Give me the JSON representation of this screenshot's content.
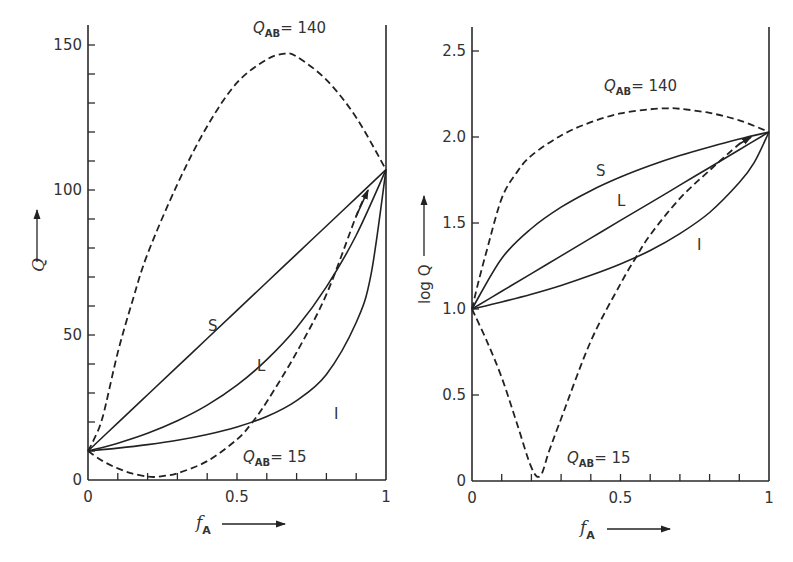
{
  "chart_data": [
    {
      "type": "line",
      "panel": "left",
      "title": "",
      "xlabel": "f_A",
      "ylabel": "Q",
      "xlim": [
        0,
        1
      ],
      "ylim": [
        0,
        158
      ],
      "x_ticks": [
        0,
        0.5,
        1
      ],
      "x_tick_labels": [
        "0",
        "0.5",
        "1"
      ],
      "x_minor_step": 0.1,
      "y_ticks": [
        0,
        50,
        100,
        150
      ],
      "y_tick_labels": [
        "0",
        "50",
        "100",
        "150"
      ],
      "y_minor_step": 10,
      "grid": false,
      "legend": "none (curves labeled inline)",
      "series": [
        {
          "name": "S",
          "style": "solid",
          "x": [
            0,
            0.1,
            0.2,
            0.3,
            0.4,
            0.5,
            0.6,
            0.7,
            0.8,
            0.9,
            1
          ],
          "values": [
            10,
            19.7,
            29.4,
            39.1,
            48.8,
            58.5,
            68.2,
            77.9,
            87.6,
            97.3,
            107
          ]
        },
        {
          "name": "L",
          "style": "solid",
          "x": [
            0,
            0.1,
            0.2,
            0.3,
            0.4,
            0.5,
            0.6,
            0.7,
            0.8,
            0.9,
            1
          ],
          "values": [
            10,
            12.7,
            16.1,
            20.4,
            25.8,
            32.7,
            41.5,
            52.5,
            66.6,
            84.4,
            107
          ]
        },
        {
          "name": "I",
          "style": "solid",
          "x": [
            0,
            0.1,
            0.2,
            0.3,
            0.4,
            0.5,
            0.6,
            0.7,
            0.8,
            0.9,
            0.95,
            1
          ],
          "values": [
            10,
            11.0,
            12.2,
            13.7,
            15.7,
            18.3,
            21.9,
            27.4,
            36.4,
            54.3,
            71,
            107
          ]
        },
        {
          "name": "Q_AB=140",
          "style": "dashed",
          "x": [
            0,
            0.02,
            0.05,
            0.1,
            0.15,
            0.2,
            0.3,
            0.4,
            0.5,
            0.6,
            0.66,
            0.7,
            0.8,
            0.9,
            1
          ],
          "values": [
            10,
            14,
            22,
            44,
            62,
            78,
            102,
            122,
            137,
            145,
            147,
            146,
            138,
            125,
            107
          ]
        },
        {
          "name": "Q_AB=15",
          "style": "dashed",
          "x": [
            0,
            0.05,
            0.1,
            0.15,
            0.2,
            0.23,
            0.26,
            0.3,
            0.4,
            0.5,
            0.55,
            0.6,
            0.7,
            0.8,
            0.9,
            0.94
          ],
          "values": [
            10,
            6.5,
            4,
            2.2,
            1.2,
            1.07,
            1.5,
            2.3,
            6.5,
            14,
            19.7,
            27,
            44,
            64,
            91,
            100
          ]
        }
      ],
      "annotations": [
        {
          "text": "Q_AB = 140",
          "x": 0.6,
          "y": 152
        },
        {
          "text": "Q_AB = 15",
          "x": 0.55,
          "y": 9
        },
        {
          "text": "S",
          "x": 0.43,
          "y": 62
        },
        {
          "text": "L",
          "x": 0.6,
          "y": 45
        },
        {
          "text": "I",
          "x": 0.85,
          "y": 30
        }
      ]
    },
    {
      "type": "line",
      "panel": "right",
      "title": "",
      "xlabel": "f_A",
      "ylabel": "log Q",
      "xlim": [
        0,
        1
      ],
      "ylim": [
        0,
        2.65
      ],
      "x_ticks": [
        0,
        0.5,
        1
      ],
      "x_tick_labels": [
        "0",
        "0.5",
        "1"
      ],
      "x_minor_step": 0.1,
      "y_ticks": [
        0,
        0.5,
        1.0,
        1.5,
        2.0,
        2.5
      ],
      "y_tick_labels": [
        "0",
        "0.5",
        "1.0",
        "1.5",
        "2.0",
        "2.5"
      ],
      "grid": false,
      "legend": "none (curves labeled inline)",
      "series": [
        {
          "name": "S",
          "style": "solid",
          "x": [
            0,
            0.1,
            0.2,
            0.3,
            0.4,
            0.5,
            0.6,
            0.7,
            0.8,
            0.9,
            1
          ],
          "values": [
            1.0,
            1.294,
            1.468,
            1.592,
            1.688,
            1.767,
            1.834,
            1.892,
            1.942,
            1.988,
            2.029
          ]
        },
        {
          "name": "L",
          "style": "solid",
          "x": [
            0,
            0.1,
            0.2,
            0.3,
            0.4,
            0.5,
            0.6,
            0.7,
            0.8,
            0.9,
            1
          ],
          "values": [
            1.0,
            1.103,
            1.206,
            1.309,
            1.412,
            1.515,
            1.617,
            1.72,
            1.823,
            1.926,
            2.029
          ]
        },
        {
          "name": "I",
          "style": "solid",
          "x": [
            0,
            0.1,
            0.2,
            0.3,
            0.4,
            0.5,
            0.6,
            0.7,
            0.8,
            0.9,
            0.95,
            1
          ],
          "values": [
            1.0,
            1.041,
            1.086,
            1.137,
            1.196,
            1.262,
            1.34,
            1.438,
            1.561,
            1.735,
            1.851,
            2.029
          ]
        },
        {
          "name": "Q_AB=140",
          "style": "dashed",
          "x": [
            0,
            0.02,
            0.05,
            0.1,
            0.15,
            0.2,
            0.3,
            0.4,
            0.5,
            0.6,
            0.66,
            0.7,
            0.8,
            0.9,
            1
          ],
          "values": [
            1.0,
            1.146,
            1.342,
            1.643,
            1.792,
            1.892,
            2.009,
            2.086,
            2.137,
            2.161,
            2.167,
            2.164,
            2.14,
            2.097,
            2.029
          ]
        },
        {
          "name": "Q_AB=15",
          "style": "dashed",
          "x": [
            0,
            0.05,
            0.1,
            0.15,
            0.2,
            0.23,
            0.26,
            0.3,
            0.4,
            0.5,
            0.55,
            0.6,
            0.7,
            0.8,
            0.9,
            0.94
          ],
          "values": [
            1.0,
            0.813,
            0.602,
            0.342,
            0.079,
            0.03,
            0.176,
            0.362,
            0.813,
            1.146,
            1.294,
            1.431,
            1.643,
            1.806,
            1.959,
            2.0
          ]
        }
      ],
      "annotations": [
        {
          "text": "Q_AB = 140",
          "x": 0.5,
          "y": 2.33
        },
        {
          "text": "Q_AB = 15",
          "x": 0.45,
          "y": 0.1
        },
        {
          "text": "S",
          "x": 0.44,
          "y": 1.84
        },
        {
          "text": "L",
          "x": 0.5,
          "y": 1.65
        },
        {
          "text": "I",
          "x": 0.77,
          "y": 1.4
        }
      ]
    }
  ],
  "labels": {
    "left_ylabel": "Q",
    "right_ylabel": "log Q",
    "xlabel_main": "f",
    "xlabel_sub": "A",
    "qab_main": "Q",
    "qab_sub": "AB",
    "qab_140": "= 140",
    "qab_15": "= 15"
  }
}
